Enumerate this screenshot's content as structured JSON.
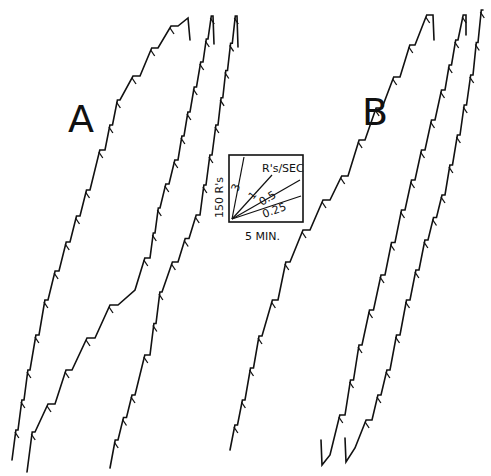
{
  "panels": {
    "a": {
      "label": "A"
    },
    "b": {
      "label": "B"
    }
  },
  "key": {
    "y_label": "150 R's",
    "x_label": "5 MIN.",
    "rate_header": "R's/SEC",
    "rates": [
      "3",
      "1",
      "0.5",
      "0.25"
    ]
  },
  "chart_data": {
    "type": "line",
    "title": "",
    "subtitle": "Cumulative response records (stepped)",
    "xlabel": "5 MIN.",
    "ylabel": "150 R's",
    "legend": {
      "position": "center",
      "header": "R's/SEC",
      "entries": [
        "3",
        "1",
        "0.5",
        "0.25"
      ]
    },
    "grid": false,
    "panels": [
      {
        "name": "A",
        "series": [
          {
            "name": "A-record-1",
            "points": [
              [
                12,
                460
              ],
              [
                30,
                370
              ],
              [
                48,
                300
              ],
              [
                70,
                242
              ],
              [
                90,
                190
              ],
              [
                105,
                150
              ],
              [
                120,
                100
              ],
              [
                140,
                76
              ],
              [
                158,
                48
              ],
              [
                178,
                26
              ],
              [
                188,
                18
              ],
              [
                190,
                40
              ]
            ]
          },
          {
            "name": "A-record-2",
            "points": [
              [
                27,
                472
              ],
              [
                35,
                432
              ],
              [
                55,
                404
              ],
              [
                72,
                370
              ],
              [
                95,
                338
              ],
              [
                118,
                305
              ],
              [
                135,
                290
              ],
              [
                150,
                258
              ],
              [
                160,
                208
              ],
              [
                178,
                160
              ],
              [
                190,
                112
              ],
              [
                203,
                62
              ],
              [
                213,
                16
              ],
              [
                214,
                44
              ]
            ]
          },
          {
            "name": "A-record-3",
            "points": [
              [
                110,
                468
              ],
              [
                118,
                440
              ],
              [
                135,
                395
              ],
              [
                150,
                355
              ],
              [
                162,
                292
              ],
              [
                178,
                262
              ],
              [
                200,
                215
              ],
              [
                218,
                125
              ],
              [
                237,
                16
              ],
              [
                238,
                47
              ]
            ]
          }
        ]
      },
      {
        "name": "B",
        "series": [
          {
            "name": "B-record-1",
            "points": [
              [
                230,
                450
              ],
              [
                245,
                400
              ],
              [
                262,
                336
              ],
              [
                278,
                300
              ],
              [
                290,
                262
              ],
              [
                310,
                230
              ],
              [
                330,
                200
              ],
              [
                348,
                176
              ],
              [
                365,
                140
              ],
              [
                382,
                108
              ],
              [
                400,
                77
              ],
              [
                415,
                45
              ],
              [
                433,
                15
              ],
              [
                434,
                40
              ]
            ]
          },
          {
            "name": "B-record-2",
            "points": [
              [
                321,
                440
              ],
              [
                322,
                465
              ],
              [
                330,
                455
              ],
              [
                345,
                415
              ],
              [
                362,
                345
              ],
              [
                385,
                275
              ],
              [
                405,
                210
              ],
              [
                425,
                150
              ],
              [
                445,
                90
              ],
              [
                458,
                40
              ],
              [
                466,
                15
              ],
              [
                466,
                35
              ]
            ]
          },
          {
            "name": "B-record-3",
            "points": [
              [
                345,
                438
              ],
              [
                346,
                462
              ],
              [
                355,
                448
              ],
              [
                372,
                420
              ],
              [
                390,
                370
              ],
              [
                410,
                300
              ],
              [
                428,
                240
              ],
              [
                445,
                195
              ],
              [
                460,
                135
              ],
              [
                473,
                75
              ],
              [
                483,
                10
              ]
            ]
          }
        ]
      }
    ]
  }
}
